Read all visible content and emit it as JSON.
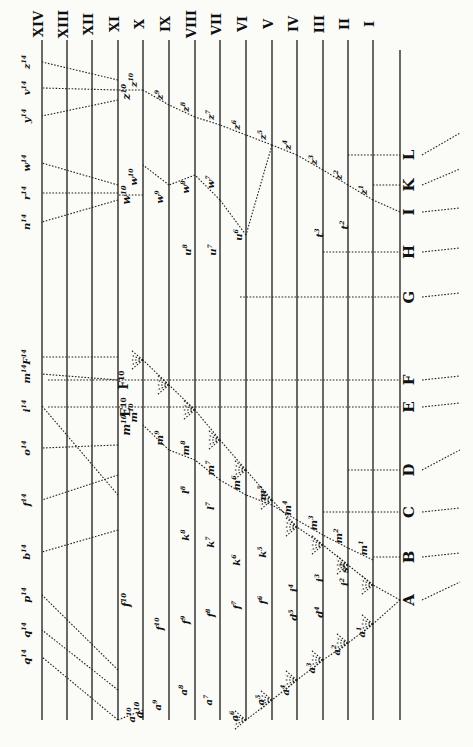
{
  "figure": {
    "generations": [
      "XIV",
      "XIII",
      "XII",
      "XI",
      "X",
      "IX",
      "VIII",
      "VII",
      "VI",
      "V",
      "IV",
      "III",
      "II",
      "I"
    ],
    "ancestral_species": [
      "A",
      "B",
      "C",
      "D",
      "E",
      "F",
      "G",
      "H",
      "I",
      "K",
      "L"
    ],
    "top_species_left": [
      "q14",
      "q14",
      "p14",
      "b14",
      "f14",
      "o14",
      "i14",
      "m14",
      "F14"
    ],
    "top_species_right": [
      "n14",
      "r14",
      "w14",
      "y14",
      "v14",
      "z14"
    ],
    "gen10_labels": [
      "a10",
      "f10",
      "m10",
      "E10",
      "F10",
      "w10",
      "z10"
    ],
    "a_branch": [
      "a1",
      "a2",
      "a3",
      "a4",
      "a5",
      "a6",
      "a7",
      "a8",
      "a9",
      "a10"
    ],
    "d_branch": [
      "d4",
      "d5"
    ],
    "f_branch": [
      "f6",
      "f7",
      "f8",
      "f9",
      "f10"
    ],
    "i_branch": [
      "i2",
      "i3",
      "i4"
    ],
    "k_branch": [
      "k5",
      "k6",
      "k7",
      "k8"
    ],
    "l_branch": [
      "l7",
      "l8"
    ],
    "m_branch": [
      "m1",
      "m2",
      "m3",
      "m4",
      "m5",
      "m6",
      "m7",
      "m8",
      "m9",
      "m10"
    ],
    "s_branch": [
      "s2"
    ],
    "t_branch": [
      "t2",
      "t3"
    ],
    "u_branch": [
      "u6",
      "u7",
      "u8"
    ],
    "w_branch": [
      "w7",
      "w8",
      "w9",
      "w10"
    ],
    "z_branch": [
      "z1",
      "z2",
      "z3",
      "z4",
      "z5",
      "z6",
      "z7",
      "z8",
      "z9",
      "z10"
    ]
  }
}
